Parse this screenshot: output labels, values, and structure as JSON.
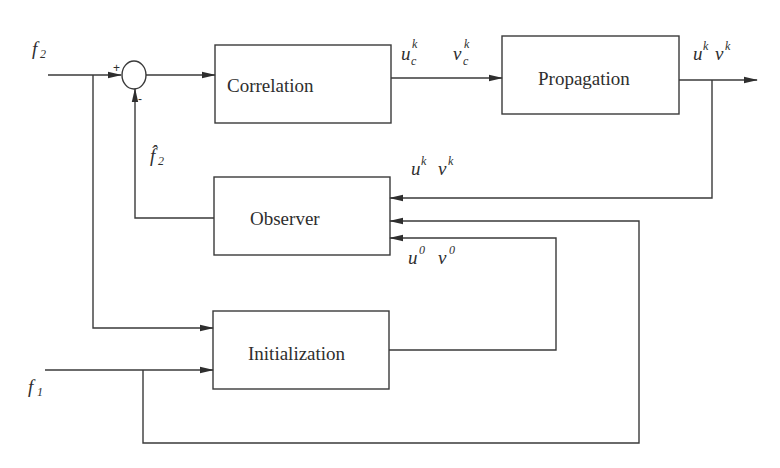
{
  "diagram": {
    "type": "block-diagram",
    "colors": {
      "line": "#3a3a3a",
      "background": "#ffffff"
    },
    "blocks": {
      "correlation": {
        "label": "Correlation"
      },
      "propagation": {
        "label": "Propagation"
      },
      "observer": {
        "label": "Observer"
      },
      "initialization": {
        "label": "Initialization"
      }
    },
    "summing_junction": {
      "plus_sign": "+",
      "minus_sign": "-"
    },
    "signals": {
      "f2": {
        "base": "f",
        "sub": "2"
      },
      "f1": {
        "base": "f",
        "sub": "1"
      },
      "f2_hat": {
        "base": "f̂",
        "sub": "2"
      },
      "uc_k": {
        "base": "u",
        "sub": "c",
        "sup": "k"
      },
      "vc_k": {
        "base": "v",
        "sub": "c",
        "sup": "k"
      },
      "uk_out": {
        "base_u": "u",
        "sup_u": "k",
        "base_v": "v",
        "sup_v": "k"
      },
      "uk_fb": {
        "base_u": "u",
        "sup_u": "k",
        "base_v": "v",
        "sup_v": "k"
      },
      "u0": {
        "base_u": "u",
        "sup_u": "0",
        "base_v": "v",
        "sup_v": "0"
      }
    }
  }
}
